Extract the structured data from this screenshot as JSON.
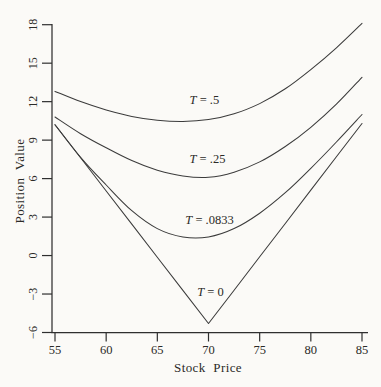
{
  "figure": {
    "background_color": "#fbfaf7",
    "curve_color": "#3b3b3b",
    "axis_color": "#2f2f2f",
    "text_color": "#2b2a27"
  },
  "chart_data": {
    "type": "line",
    "title": "",
    "xlabel": "Stock Price",
    "ylabel": "Position Value",
    "xlim": [
      55,
      85
    ],
    "ylim": [
      -6,
      18
    ],
    "xticks": [
      55,
      60,
      65,
      70,
      75,
      80,
      85
    ],
    "yticks": [
      18,
      15,
      12,
      9,
      6,
      3,
      0,
      -3,
      -6
    ],
    "grid": false,
    "legend": "inline curve labels",
    "x": [
      55,
      57.5,
      60,
      62.5,
      65,
      67.5,
      70,
      72.5,
      75,
      77.5,
      80,
      82.5,
      85
    ],
    "series": [
      {
        "name": "T = .5",
        "smooth": true,
        "values": [
          12.8,
          12.0,
          11.35,
          10.85,
          10.55,
          10.45,
          10.6,
          11.05,
          11.85,
          13.0,
          14.5,
          16.2,
          18.1
        ]
      },
      {
        "name": "T = .25",
        "smooth": true,
        "values": [
          10.8,
          9.5,
          8.4,
          7.4,
          6.65,
          6.2,
          6.1,
          6.5,
          7.3,
          8.5,
          10.0,
          11.8,
          13.9
        ]
      },
      {
        "name": "T = .0833",
        "smooth": true,
        "values": [
          10.2,
          7.65,
          5.5,
          3.5,
          2.1,
          1.45,
          1.45,
          2.1,
          3.3,
          4.9,
          6.8,
          8.85,
          11.0
        ]
      },
      {
        "name": "T = 0",
        "smooth": false,
        "values": [
          10.2,
          7.62,
          5.03,
          2.45,
          -0.13,
          -2.72,
          -5.3,
          -2.7,
          -0.1,
          2.5,
          5.1,
          7.7,
          10.3
        ]
      }
    ],
    "annotations": [
      {
        "prefix": "T",
        "suffix": " = .5",
        "x": 69.6,
        "y": 12.15
      },
      {
        "prefix": "T",
        "suffix": " = .25",
        "x": 69.9,
        "y": 7.55
      },
      {
        "prefix": "T",
        "suffix": " = .0833",
        "x": 70.1,
        "y": 2.75
      },
      {
        "prefix": "T",
        "suffix": " = 0",
        "x": 70.2,
        "y": -2.85
      }
    ]
  }
}
